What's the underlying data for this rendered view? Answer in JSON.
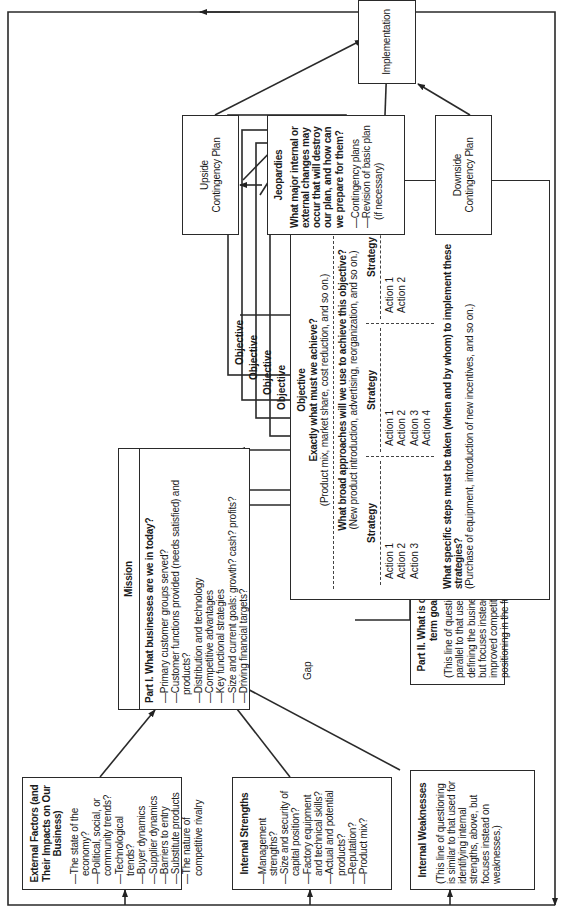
{
  "external_factors": {
    "title": "External Factors (and Their Impacts on Our Business)",
    "items": [
      "—The state of the economy?",
      "—Political, social, or community trends?",
      "—Technological trends?",
      "—Buyer dynamics",
      "—Supplier dynamics",
      "—Barriers to entry",
      "—Substitute products",
      "—The nature of competitive rivalry"
    ]
  },
  "internal_strengths": {
    "title": "Internal Strengths",
    "items": [
      "—Management strengths?",
      "—Size and security of capital position?",
      "—Factory equipment and technical skills?",
      "—Actual and potential products?",
      "—Reputation?",
      "—Product mix?"
    ]
  },
  "internal_weaknesses": {
    "title": "Internal Weaknesses",
    "body": "(This line of questioning is similar to that used for identifying internal strengths, above, but focuses instead on weaknesses.)"
  },
  "mission": {
    "title": "Mission",
    "part1_heading": "Part I. What businesses are we in today?",
    "items": [
      "—Primary customer groups served?",
      "—Customer functions provided (needs satisfied) and products?",
      "—Distribution and technology",
      "—Competitive advantages",
      "—Key functional strategies",
      "—Size and current goals: growth? cash? profits?",
      "—Driving financial targets?"
    ]
  },
  "gap_label": "Gap",
  "part2": {
    "heading": "Part II. What is our long-term goal?",
    "body": "(This line of questioning is parallel to that used in defining the business today, but focuses instead on an improved competitive positioning in the future.)"
  },
  "objective_stack": {
    "tab_labels": [
      "Objective",
      "Objective",
      "Objective",
      "Objective"
    ],
    "title": "Objective",
    "q1": "Exactly what must we achieve?",
    "q1_note": "(Product mix, market share, cost reduction, and so on.)",
    "q2": "What broad approaches will we use to achieve this objective?",
    "q2_note": "(New product introduction, advertising, reorganization, and so on.)",
    "strategies": [
      {
        "label": "Strategy",
        "actions": [
          "Action 1",
          "Action 2",
          "Action 3"
        ]
      },
      {
        "label": "Strategy",
        "actions": [
          "Action 1",
          "Action 2",
          "Action 3",
          "Action 4"
        ]
      },
      {
        "label": "Strategy",
        "actions": [
          "Action 1",
          "Action 2"
        ]
      }
    ],
    "q3": "What specific steps must be taken (when and by whom) to implement these strategies?",
    "q3_note": "(Purchase of equipment, introduction of new incentives, and so on.)"
  },
  "jeopardies": {
    "title": "Jeopardies",
    "question": "What major internal or external changes may occur that will destroy our plan, and how can we prepare for them?",
    "items": [
      "—Contingency plans",
      "—Revision of basic plan (if necessary)"
    ]
  },
  "upside": {
    "label": "Upside Contingency Plan"
  },
  "downside": {
    "label": "Downside Contingency Plan"
  },
  "implementation": {
    "label": "Implementation"
  }
}
